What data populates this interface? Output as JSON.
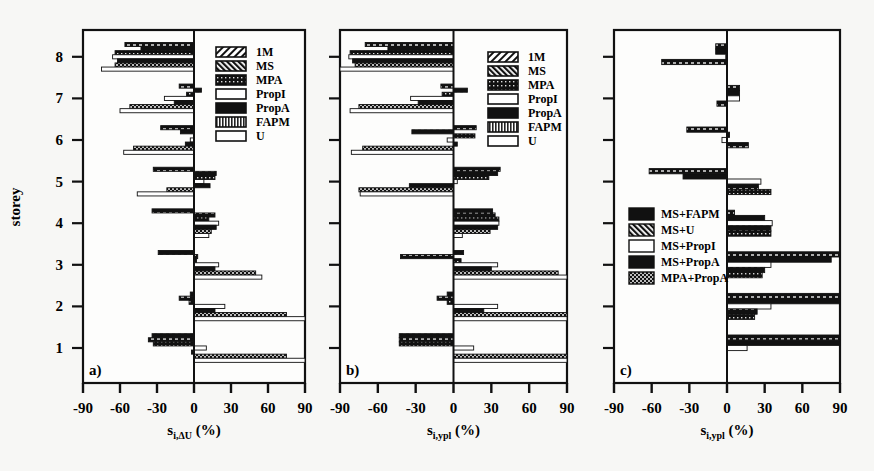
{
  "chart_data": [
    {
      "type": "bar",
      "orientation": "horizontal",
      "panel_label": "a)",
      "xlabel": "s_{i,ΔU} (%)",
      "ylabel": "storey",
      "xlim": [
        -90,
        90
      ],
      "xticks": [
        -90,
        -60,
        -30,
        0,
        30,
        60,
        90
      ],
      "categories": [
        1,
        2,
        3,
        4,
        5,
        6,
        7,
        8
      ],
      "legend_position": "upper right",
      "series": [
        {
          "name": "1M",
          "values": [
            -34,
            -3,
            -29,
            -34,
            -33,
            -27,
            -12,
            -56
          ]
        },
        {
          "name": "MS",
          "values": [
            -37,
            -12,
            3,
            17,
            18,
            -11,
            6,
            -43
          ]
        },
        {
          "name": "MPA",
          "values": [
            -33,
            -4,
            2,
            12,
            17,
            0,
            -6,
            -64
          ]
        },
        {
          "name": "PropI",
          "values": [
            10,
            25,
            20,
            20,
            8,
            -3,
            -24,
            -66
          ]
        },
        {
          "name": "PropA",
          "values": [
            -2,
            17,
            17,
            18,
            13,
            -7,
            -16,
            -62
          ]
        },
        {
          "name": "FAPM",
          "values": [
            75,
            75,
            50,
            14,
            -22,
            -49,
            -52,
            -64
          ]
        },
        {
          "name": "U",
          "values": [
            90,
            90,
            55,
            12,
            -46,
            -57,
            -60,
            -75
          ]
        }
      ]
    },
    {
      "type": "bar",
      "orientation": "horizontal",
      "panel_label": "b)",
      "xlabel": "s_{i,ypl} (%)",
      "ylabel": "storey",
      "xlim": [
        -90,
        90
      ],
      "xticks": [
        -90,
        -60,
        -30,
        0,
        30,
        60,
        90
      ],
      "categories": [
        1,
        2,
        3,
        4,
        5,
        6,
        7,
        8
      ],
      "legend_position": "upper right",
      "series": [
        {
          "name": "1M",
          "values": [
            -43,
            -5,
            8,
            31,
            37,
            18,
            -10,
            -70
          ]
        },
        {
          "name": "MS",
          "values": [
            -43,
            -13,
            -42,
            33,
            35,
            -33,
            11,
            -52
          ]
        },
        {
          "name": "MPA",
          "values": [
            -43,
            -5,
            6,
            36,
            28,
            17,
            -9,
            -82
          ]
        },
        {
          "name": "PropI",
          "values": [
            16,
            35,
            35,
            36,
            3,
            -5,
            -34,
            -83
          ]
        },
        {
          "name": "PropA",
          "values": [
            0,
            24,
            30,
            35,
            -35,
            3,
            -28,
            -80
          ]
        },
        {
          "name": "FAPM",
          "values": [
            90,
            90,
            83,
            29,
            -75,
            -72,
            -75,
            -78
          ]
        },
        {
          "name": "U",
          "values": [
            90,
            90,
            90,
            7,
            -74,
            -81,
            -82,
            -91
          ]
        }
      ]
    },
    {
      "type": "bar",
      "orientation": "horizontal",
      "panel_label": "c)",
      "xlabel": "s_{i,ypl} (%)",
      "ylabel": "storey",
      "xlim": [
        -90,
        90
      ],
      "xticks": [
        -90,
        -60,
        -30,
        0,
        30,
        60,
        90
      ],
      "categories": [
        1,
        2,
        3,
        4,
        5,
        6,
        7,
        8
      ],
      "legend_position": "lower left",
      "series": [
        {
          "name": "MS+FAPM",
          "values": [
            90,
            90,
            90,
            6,
            -62,
            -32,
            10,
            -9
          ]
        },
        {
          "name": "MS+U",
          "values": [
            90,
            90,
            83,
            30,
            -35,
            2,
            10,
            -9
          ]
        },
        {
          "name": "MS+PropI",
          "values": [
            16,
            35,
            35,
            36,
            27,
            -4,
            10,
            -1
          ]
        },
        {
          "name": "MS+PropA",
          "values": [
            0,
            24,
            30,
            35,
            25,
            17,
            -8,
            -52
          ]
        },
        {
          "name": "MPA+PropA",
          "values": [
            0,
            22,
            28,
            35,
            35,
            0,
            0,
            0
          ]
        }
      ]
    }
  ],
  "axes": {
    "ylabel": "storey",
    "yticks": [
      "1",
      "2",
      "3",
      "4",
      "5",
      "6",
      "7",
      "8"
    ],
    "xticks": [
      "-90",
      "-60",
      "-30",
      "0",
      "30",
      "60",
      "90"
    ]
  },
  "panels": {
    "a": {
      "label": "a)",
      "xlabel_main": "s",
      "xlabel_sub": "i,ΔU",
      "xlabel_unit": " (%)"
    },
    "b": {
      "label": "b)",
      "xlabel_main": "s",
      "xlabel_sub": "i,ypl",
      "xlabel_unit": " (%)"
    },
    "c": {
      "label": "c)",
      "xlabel_main": "s",
      "xlabel_sub": "i,ypl",
      "xlabel_unit": " (%)"
    }
  },
  "legend_ab": [
    "1M",
    "MS",
    "MPA",
    "PropI",
    "PropA",
    "FAPM",
    "U"
  ],
  "legend_c": [
    "MS+FAPM",
    "MS+U",
    "MS+PropI",
    "MS+PropA",
    "MPA+PropA"
  ]
}
